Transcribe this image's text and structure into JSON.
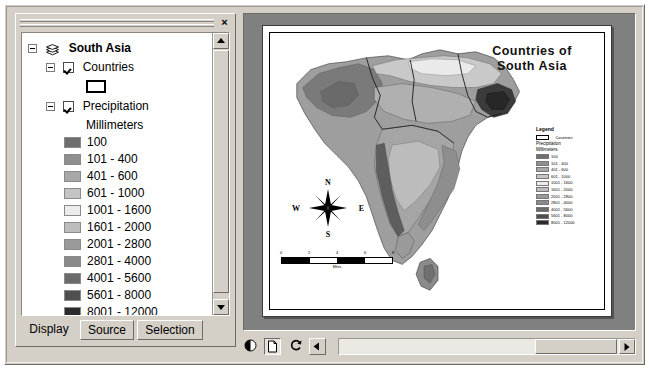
{
  "toc": {
    "close_label": "×",
    "tree": {
      "dataframe": {
        "label": "South Asia",
        "icon": "layers-stack-icon"
      },
      "countries": {
        "label": "Countries",
        "swatch_icon": "hollow-rectangle-swatch"
      },
      "precipitation": {
        "label": "Precipitation",
        "units_label": "Millimeters"
      }
    },
    "legend_classes": [
      {
        "label": "100",
        "color": "#6e6e6e"
      },
      {
        "label": "101 - 400",
        "color": "#8f8f8f"
      },
      {
        "label": "401 - 600",
        "color": "#a8a8a8"
      },
      {
        "label": "601 - 1000",
        "color": "#c4c4c4"
      },
      {
        "label": "1001 - 1600",
        "color": "#ececec"
      },
      {
        "label": "1601 - 2000",
        "color": "#bdbdbd"
      },
      {
        "label": "2001 - 2800",
        "color": "#9a9a9a"
      },
      {
        "label": "2801 - 4000",
        "color": "#8a8a8a"
      },
      {
        "label": "4001 - 5600",
        "color": "#6a6a6a"
      },
      {
        "label": "5601 - 8000",
        "color": "#4f4f4f"
      },
      {
        "label": "8001 - 12000",
        "color": "#2b2b2b"
      }
    ],
    "tabs": [
      {
        "label": "Display",
        "state": "selected"
      },
      {
        "label": "Source",
        "state": "normal"
      },
      {
        "label": "Selection",
        "state": "normal"
      }
    ]
  },
  "layout": {
    "map_title": "Countries of\nSouth Asia",
    "map_title_line1": "Countries of",
    "map_title_line2": "South Asia",
    "compass": {
      "north": "N",
      "south": "S",
      "west": "W",
      "east": "E"
    },
    "scalebar": {
      "ticks": [
        "0",
        "2",
        "4",
        "6",
        "8"
      ],
      "label": "Miles"
    },
    "map_legend": {
      "title": "Legend",
      "countries_label": "Countries",
      "precipitation_label": "Precipitation",
      "units_label": "Millimeters"
    }
  },
  "view_toolbar": {
    "buttons": [
      {
        "name": "data-view-button",
        "icon": "half-circle-icon",
        "state": "normal"
      },
      {
        "name": "layout-view-button",
        "icon": "page-icon",
        "state": "pressed"
      },
      {
        "name": "refresh-button",
        "icon": "refresh-icon",
        "state": "normal"
      },
      {
        "name": "pause-draw-button",
        "icon": "left-arrow-icon",
        "state": "normal"
      }
    ]
  }
}
